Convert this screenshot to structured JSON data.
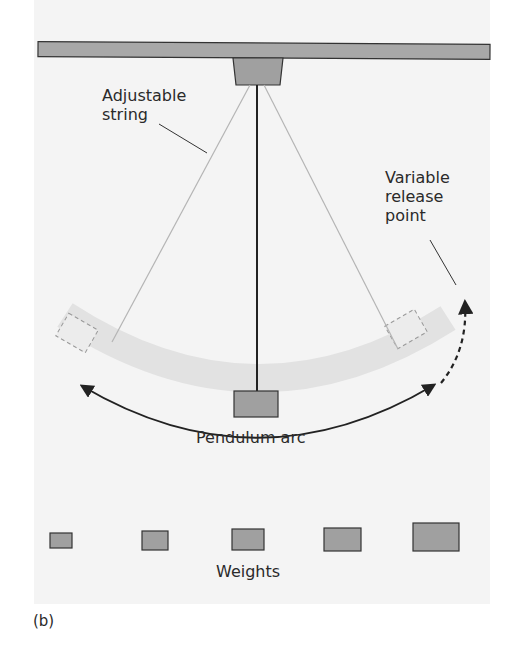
{
  "figure": {
    "panel_label": "(b)",
    "labels": {
      "adjustable_string_line1": "Adjustable",
      "adjustable_string_line2": "string",
      "variable_release_line1": "Variable",
      "variable_release_line2": "release",
      "variable_release_line3": "point",
      "pendulum_arc": "Pendulum arc",
      "weights": "Weights"
    },
    "weights_count": 5,
    "colors": {
      "background": "#f4f4f4",
      "beam_fill": "#a8a8a8",
      "block_fill": "#a0a0a0",
      "arc_band": "#e2e2e2",
      "outline": "#333333",
      "string": "#b5b5b5",
      "text": "#2a2a2a"
    }
  }
}
